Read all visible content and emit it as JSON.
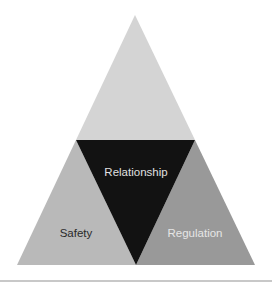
{
  "diagram": {
    "title": "",
    "segments": {
      "top": {
        "label": "",
        "color": "#d4d4d4"
      },
      "center": {
        "label": "Relationship",
        "color": "#121212",
        "text_color": "#e0e0e0"
      },
      "left": {
        "label": "Safety",
        "color": "#b9b9b9",
        "text_color": "#2a2a2a"
      },
      "right": {
        "label": "Regulation",
        "color": "#999999",
        "text_color": "#e6e6e6"
      }
    }
  },
  "divider_color": "#c8c8c8"
}
